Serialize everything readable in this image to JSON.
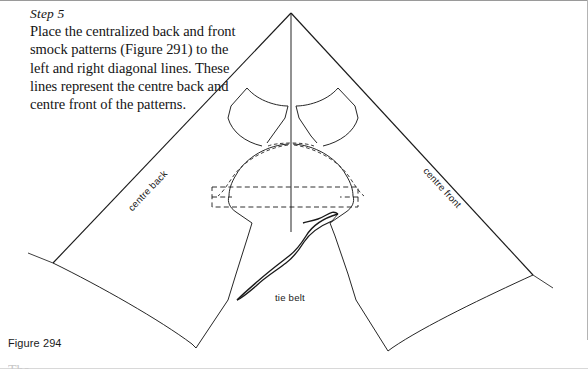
{
  "page": {
    "width": 588,
    "height": 369,
    "background_color": "#ffffff",
    "ink_color": "#1a1a1a"
  },
  "instructions": {
    "step_label": "Step 5",
    "body": "Place the centralized back and front smock patterns (Figure 291) to the left and right diagonal lines. These lines represent the centre back and centre front of the patterns."
  },
  "caption": {
    "figure_number": "Figure 294",
    "cut_off_row": "The"
  },
  "diagram": {
    "labels": {
      "centre_back": "centre back",
      "centre_front": "centre front",
      "tie_belt": "tie belt"
    },
    "apex": {
      "x": 291,
      "y": 13
    },
    "left_corner": {
      "x": 53,
      "y": 263
    },
    "right_corner": {
      "x": 533,
      "y": 275
    },
    "centre_line_bottom": {
      "x": 291,
      "y": 232
    },
    "dashed_rectangle": {
      "x": 212,
      "y": 187,
      "width": 146,
      "height": 20
    }
  }
}
